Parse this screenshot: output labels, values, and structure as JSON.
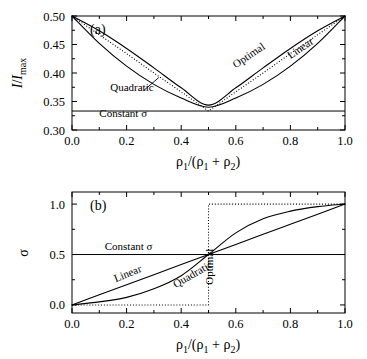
{
  "figure": {
    "panels": [
      "a",
      "b"
    ]
  },
  "panel_a": {
    "id": "(a)",
    "xlabel_parts": {
      "rho": "ρ",
      "sub1": "1",
      "slash": "/(",
      "sub2": "2",
      "close": ")",
      "plus": "+"
    },
    "ylabel": "I/Imax",
    "xticks": [
      "0.0",
      "0.2",
      "0.4",
      "0.6",
      "0.8",
      "1.0"
    ],
    "yticks": [
      "0.30",
      "0.35",
      "0.40",
      "0.45",
      "0.50"
    ],
    "annotations": {
      "quadratic": "Quadratic",
      "optimal": "Optimal",
      "linear": "Linear",
      "constant": "Constant σ"
    }
  },
  "panel_b": {
    "id": "(b)",
    "ylabel": "σ",
    "xticks": [
      "0.0",
      "0.2",
      "0.4",
      "0.6",
      "0.8",
      "1.0"
    ],
    "yticks": [
      "0.0",
      "0.5",
      "1.0"
    ],
    "annotations": {
      "constant": "Constant σ",
      "linear": "Linear",
      "quadratic": "Quadratic",
      "optimal": "Optimal"
    }
  },
  "chart_data": [
    {
      "type": "line",
      "panel": "a",
      "title": "(a) Relative intensity vs density fraction",
      "xlabel": "rho_1/(rho_1 + rho_2)",
      "ylabel": "I/I_max",
      "xlim": [
        0.0,
        1.0
      ],
      "ylim": [
        0.3,
        0.5
      ],
      "xticks": [
        0.0,
        0.2,
        0.4,
        0.6,
        0.8,
        1.0
      ],
      "yticks": [
        0.3,
        0.35,
        0.4,
        0.45,
        0.5
      ],
      "grid": false,
      "legend": "inline-annotations",
      "series": [
        {
          "name": "Constant σ",
          "style": "solid-horizontal",
          "x": [
            0.0,
            1.0
          ],
          "y": [
            0.3333,
            0.3333
          ]
        },
        {
          "name": "Optimal",
          "style": "dotted",
          "x": [
            0.0,
            0.1,
            0.2,
            0.3,
            0.4,
            0.5,
            0.6,
            0.7,
            0.8,
            0.9,
            1.0
          ],
          "y": [
            0.5,
            0.467,
            0.434,
            0.4,
            0.367,
            0.3333,
            0.367,
            0.4,
            0.434,
            0.467,
            0.5
          ]
        },
        {
          "name": "Linear",
          "style": "solid",
          "x": [
            0.0,
            0.1,
            0.2,
            0.3,
            0.4,
            0.5,
            0.6,
            0.7,
            0.8,
            0.9,
            1.0
          ],
          "y": [
            0.5,
            0.474,
            0.443,
            0.409,
            0.374,
            0.3437,
            0.374,
            0.409,
            0.443,
            0.474,
            0.5
          ]
        },
        {
          "name": "Quadratic",
          "style": "solid",
          "x": [
            0.0,
            0.1,
            0.2,
            0.3,
            0.4,
            0.5,
            0.6,
            0.7,
            0.8,
            0.9,
            1.0
          ],
          "y": [
            0.5,
            0.452,
            0.412,
            0.38,
            0.356,
            0.34,
            0.356,
            0.38,
            0.412,
            0.452,
            0.5
          ]
        }
      ],
      "annotations": [
        {
          "text": "Quadratic",
          "x": 0.14,
          "y": 0.368,
          "rotation": 0
        },
        {
          "text": "Optimal",
          "x": 0.6,
          "y": 0.408,
          "rotation": -34
        },
        {
          "text": "Linear",
          "x": 0.8,
          "y": 0.424,
          "rotation": -34
        },
        {
          "text": "Constant σ",
          "x": 0.1,
          "y": 0.322,
          "rotation": 0
        }
      ]
    },
    {
      "type": "line",
      "panel": "b",
      "title": "(b) Sigma vs density fraction",
      "xlabel": "rho_1/(rho_1 + rho_2)",
      "ylabel": "σ",
      "xlim": [
        0.0,
        1.0
      ],
      "ylim": [
        -0.08,
        1.12
      ],
      "xticks": [
        0.0,
        0.2,
        0.4,
        0.6,
        0.8,
        1.0
      ],
      "yticks": [
        0.0,
        0.5,
        1.0
      ],
      "grid": false,
      "legend": "inline-annotations",
      "series": [
        {
          "name": "Constant σ",
          "style": "solid-horizontal",
          "x": [
            0.0,
            1.0
          ],
          "y": [
            0.5,
            0.5
          ]
        },
        {
          "name": "Optimal",
          "style": "dotted-step",
          "x": [
            0.0,
            0.5,
            0.5,
            1.0
          ],
          "y": [
            0.0,
            0.0,
            1.0,
            1.0
          ]
        },
        {
          "name": "Linear",
          "style": "solid",
          "x": [
            0.0,
            0.1,
            0.2,
            0.3,
            0.4,
            0.5,
            0.6,
            0.7,
            0.8,
            0.9,
            1.0
          ],
          "y": [
            0.0,
            0.1,
            0.2,
            0.3,
            0.4,
            0.5,
            0.6,
            0.7,
            0.8,
            0.9,
            1.0
          ]
        },
        {
          "name": "Quadratic",
          "style": "solid",
          "x": [
            0.0,
            0.1,
            0.2,
            0.3,
            0.4,
            0.5,
            0.6,
            0.7,
            0.8,
            0.9,
            1.0
          ],
          "y": [
            0.0,
            0.03,
            0.075,
            0.16,
            0.29,
            0.5,
            0.715,
            0.855,
            0.93,
            0.975,
            1.0
          ]
        }
      ],
      "annotations": [
        {
          "text": "Constant σ",
          "x": 0.12,
          "y": 0.545,
          "rotation": 0
        },
        {
          "text": "Linear",
          "x": 0.16,
          "y": 0.225,
          "rotation": -22
        },
        {
          "text": "Quadratic",
          "x": 0.38,
          "y": 0.165,
          "rotation": -30
        },
        {
          "text": "Optimal",
          "x": 0.515,
          "y": 0.2,
          "rotation": -90
        }
      ]
    }
  ]
}
